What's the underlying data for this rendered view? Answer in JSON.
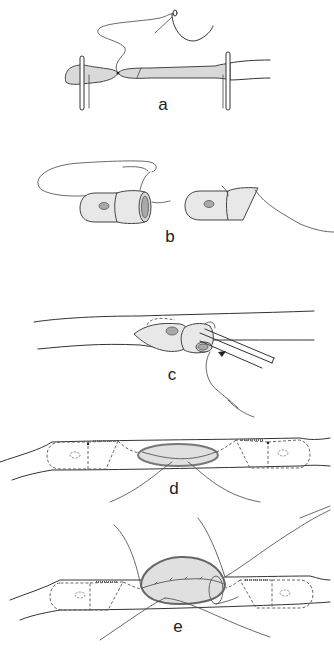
{
  "figure": {
    "panels": [
      {
        "id": "a",
        "label": "a"
      },
      {
        "id": "b",
        "label": "b"
      },
      {
        "id": "c",
        "label": "c"
      },
      {
        "id": "d",
        "label": "d"
      },
      {
        "id": "e",
        "label": "e"
      }
    ],
    "colors": {
      "line": "#333333",
      "tissue_fill": "#d9d9d9",
      "nucleus_fill": "#a9a9a9",
      "background": "#ffffff"
    }
  }
}
